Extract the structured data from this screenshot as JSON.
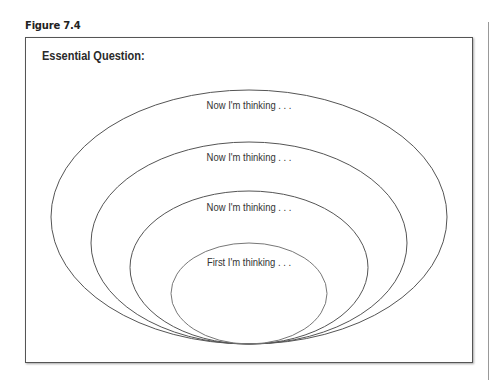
{
  "figure": {
    "label": "Figure 7.4"
  },
  "organizer": {
    "heading": "Essential Question:",
    "rings": [
      {
        "label": "Now I'm thinking . . .",
        "level": 4
      },
      {
        "label": "Now I'm thinking . . .",
        "level": 3
      },
      {
        "label": "Now I'm thinking . . .",
        "level": 2
      },
      {
        "label": "First I'm thinking . . .",
        "level": 1
      }
    ]
  },
  "colors": {
    "line": "#555555",
    "text": "#333333",
    "background": "#ffffff"
  }
}
